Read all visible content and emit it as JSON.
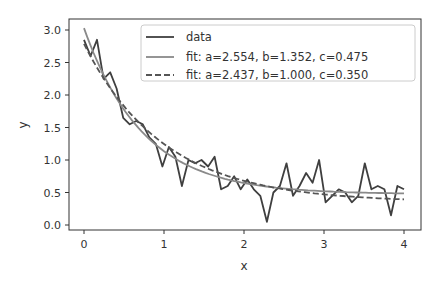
{
  "chart_data": {
    "type": "line",
    "title": "",
    "xlabel": "x",
    "ylabel": "y",
    "xlim": [
      -0.2,
      4.2
    ],
    "ylim": [
      -0.08,
      3.1
    ],
    "xticks": [
      0,
      1,
      2,
      3,
      4
    ],
    "xtick_labels": [
      "0",
      "1",
      "2",
      "3",
      "4"
    ],
    "yticks": [
      0.0,
      0.5,
      1.0,
      1.5,
      2.0,
      2.5,
      3.0
    ],
    "ytick_labels": [
      "0.0",
      "0.5",
      "1.0",
      "1.5",
      "2.0",
      "2.5",
      "3.0"
    ],
    "grid": false,
    "legend_position": "upper right",
    "series": [
      {
        "name": "data",
        "style": "solid",
        "color": "#3f3f3f",
        "x": [
          0.0,
          0.082,
          0.163,
          0.245,
          0.327,
          0.408,
          0.49,
          0.571,
          0.653,
          0.735,
          0.816,
          0.898,
          0.98,
          1.061,
          1.143,
          1.224,
          1.306,
          1.388,
          1.469,
          1.551,
          1.633,
          1.714,
          1.796,
          1.878,
          1.959,
          2.041,
          2.122,
          2.204,
          2.286,
          2.367,
          2.449,
          2.531,
          2.612,
          2.694,
          2.776,
          2.857,
          2.939,
          3.02,
          3.102,
          3.184,
          3.265,
          3.347,
          3.429,
          3.51,
          3.592,
          3.673,
          3.755,
          3.837,
          3.918,
          4.0
        ],
        "values": [
          2.85,
          2.6,
          2.85,
          2.25,
          2.35,
          2.1,
          1.65,
          1.55,
          1.6,
          1.55,
          1.35,
          1.25,
          0.9,
          1.2,
          1.05,
          0.6,
          1.0,
          0.95,
          1.0,
          0.9,
          1.05,
          0.55,
          0.6,
          0.75,
          0.55,
          0.7,
          0.55,
          0.45,
          0.05,
          0.5,
          0.6,
          0.95,
          0.45,
          0.6,
          0.8,
          0.65,
          1.0,
          0.35,
          0.45,
          0.55,
          0.5,
          0.35,
          0.45,
          0.95,
          0.55,
          0.6,
          0.55,
          0.15,
          0.6,
          0.55
        ]
      },
      {
        "name": "fit: a=2.554, b=1.352, c=0.475",
        "style": "solid",
        "color": "#8a8a8a",
        "function": "a*exp(-b*x)+c",
        "params": {
          "a": 2.554,
          "b": 1.352,
          "c": 0.475
        }
      },
      {
        "name": "fit: a=2.437, b=1.000, c=0.350",
        "style": "dashed",
        "color": "#555555",
        "function": "a*exp(-b*x)+c",
        "params": {
          "a": 2.437,
          "b": 1.0,
          "c": 0.35
        }
      }
    ]
  },
  "legend": {
    "items": [
      {
        "label": "data"
      },
      {
        "label": "fit: a=2.554, b=1.352, c=0.475"
      },
      {
        "label": "fit: a=2.437, b=1.000, c=0.350"
      }
    ]
  },
  "axes": {
    "xlabel": "x",
    "ylabel": "y"
  }
}
